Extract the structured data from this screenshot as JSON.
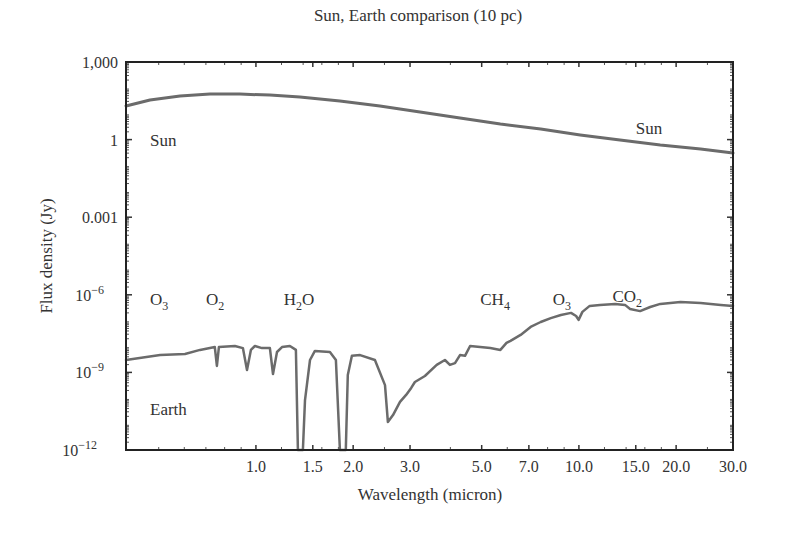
{
  "chart_data": {
    "type": "line",
    "title": "Sun, Earth comparison (10 pc)",
    "xlabel": "Wavelength (micron)",
    "ylabel": "Flux density (Jy)",
    "xscale": "log",
    "yscale": "log",
    "xlim": [
      0.396,
      30.0
    ],
    "ylim": [
      1e-12,
      1000
    ],
    "grid": false,
    "legend": "none",
    "x_ticks": [
      {
        "value": 1.0,
        "label": "1.0"
      },
      {
        "value": 1.5,
        "label": "1.5"
      },
      {
        "value": 2.0,
        "label": "2.0"
      },
      {
        "value": 3.0,
        "label": "3.0"
      },
      {
        "value": 5.0,
        "label": "5.0"
      },
      {
        "value": 7.0,
        "label": "7.0"
      },
      {
        "value": 10.0,
        "label": "10.0"
      },
      {
        "value": 15.0,
        "label": "15.0"
      },
      {
        "value": 20.0,
        "label": "20.0"
      },
      {
        "value": 30.0,
        "label": "30.0"
      }
    ],
    "y_ticks": [
      {
        "exp": 3,
        "label": "1,000",
        "sup": ""
      },
      {
        "exp": 0,
        "label": "1",
        "sup": ""
      },
      {
        "exp": -3,
        "label": "0.001",
        "sup": ""
      },
      {
        "exp": -6,
        "label": "10",
        "sup": "−6"
      },
      {
        "exp": -9,
        "label": "10",
        "sup": "−9"
      },
      {
        "exp": -12,
        "label": "10",
        "sup": "−12"
      }
    ],
    "series": [
      {
        "name": "Sun",
        "color": "#6b6b6b",
        "x": [
          0.396,
          0.47,
          0.582,
          0.721,
          0.892,
          1.105,
          1.368,
          1.82,
          2.42,
          3.22,
          4.284,
          5.713,
          7.618,
          10.09,
          13.4,
          17.87,
          23.82,
          30.0
        ],
        "log10_y": [
          1.3,
          1.53,
          1.69,
          1.76,
          1.76,
          1.72,
          1.65,
          1.49,
          1.3,
          1.07,
          0.84,
          0.6,
          0.41,
          0.18,
          -0.02,
          -0.21,
          -0.36,
          -0.52
        ]
      },
      {
        "name": "Earth",
        "color": "#6b6b6b",
        "x": [
          0.396,
          0.505,
          0.603,
          0.671,
          0.746,
          0.757,
          0.768,
          0.861,
          0.911,
          0.938,
          0.965,
          0.993,
          1.044,
          1.105,
          1.129,
          1.162,
          1.204,
          1.274,
          1.33,
          1.349,
          1.398,
          1.419,
          1.47,
          1.523,
          1.694,
          1.768,
          1.82,
          1.898,
          1.925,
          1.982,
          2.101,
          2.335,
          2.509,
          2.563,
          2.657,
          2.793,
          2.917,
          3.025,
          3.107,
          3.335,
          3.629,
          3.846,
          3.987,
          4.133,
          4.284,
          4.44,
          4.603,
          4.946,
          5.316,
          5.713,
          5.966,
          6.139,
          6.597,
          7.089,
          7.618,
          8.187,
          8.797,
          9.454,
          9.8,
          9.975,
          10.25,
          10.8,
          11.62,
          12.94,
          13.89,
          14.4,
          15.47,
          16.63,
          17.87,
          20.63,
          23.82,
          27.5,
          30.0
        ],
        "log10_y": [
          -8.52,
          -8.33,
          -8.29,
          -8.13,
          -8.02,
          -8.75,
          -8.02,
          -7.98,
          -8.06,
          -8.91,
          -8.13,
          -7.98,
          -8.06,
          -8.06,
          -9.06,
          -8.21,
          -8.02,
          -7.98,
          -8.13,
          -12.0,
          -12.0,
          -10.07,
          -8.52,
          -8.17,
          -8.21,
          -8.52,
          -12.0,
          -12.0,
          -9.1,
          -8.36,
          -8.33,
          -8.52,
          -9.49,
          -10.92,
          -10.65,
          -10.14,
          -9.87,
          -9.6,
          -9.37,
          -9.14,
          -8.71,
          -8.52,
          -8.71,
          -8.64,
          -8.33,
          -8.36,
          -7.98,
          -8.02,
          -8.06,
          -8.13,
          -7.86,
          -7.78,
          -7.55,
          -7.24,
          -7.05,
          -6.9,
          -6.78,
          -6.7,
          -6.82,
          -6.97,
          -6.66,
          -6.43,
          -6.39,
          -6.35,
          -6.39,
          -6.55,
          -6.63,
          -6.47,
          -6.35,
          -6.28,
          -6.32,
          -6.39,
          -6.43
        ]
      }
    ],
    "annotations": [
      {
        "id": "sun-label-left",
        "text": "Sun",
        "sub": "",
        "x": 0.47,
        "log10_y": 0.0
      },
      {
        "id": "sun-label-right",
        "text": "Sun",
        "sub": "",
        "x": 15.0,
        "log10_y": 0.45
      },
      {
        "id": "earth-label",
        "text": "Earth",
        "sub": "",
        "x": 0.47,
        "log10_y": -10.4
      },
      {
        "id": "o3-label-left",
        "text": "O",
        "sub": "3",
        "x": 0.47,
        "log10_y": -6.15
      },
      {
        "id": "o2-label",
        "text": "O",
        "sub": "2",
        "x": 0.7,
        "log10_y": -6.15
      },
      {
        "id": "h2o-label",
        "text": "H",
        "sub": "2",
        "tail": "O",
        "x": 1.22,
        "log10_y": -6.15
      },
      {
        "id": "ch4-label",
        "text": "CH",
        "sub": "4",
        "x": 4.95,
        "log10_y": -6.15
      },
      {
        "id": "o3-label-right",
        "text": "O",
        "sub": "3",
        "x": 8.3,
        "log10_y": -6.15
      },
      {
        "id": "co2-label",
        "text": "CO",
        "sub": "2",
        "x": 12.7,
        "log10_y": -6.05
      }
    ]
  }
}
